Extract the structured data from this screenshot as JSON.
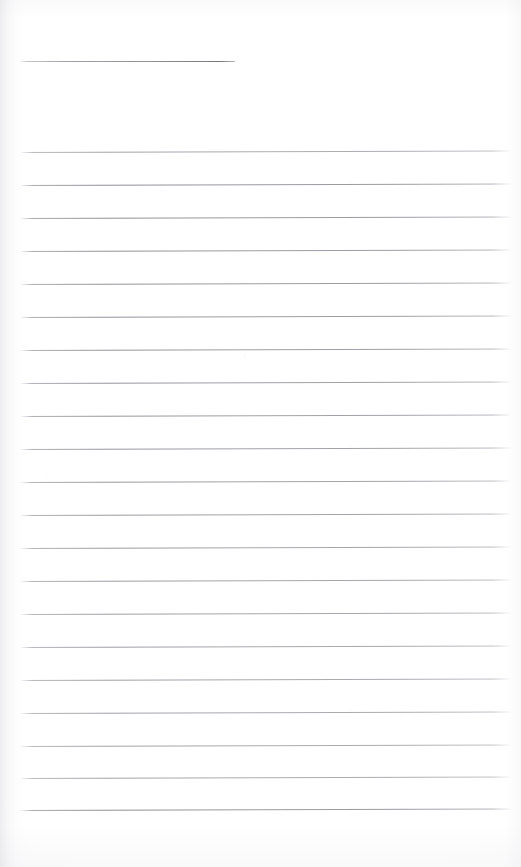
{
  "document": {
    "kind": "scanned-lined-notepad-page",
    "title": "Blank Lined Notepad Page",
    "description": "A scanned blank ruled notepad sheet with one short header rule near the top and a block of evenly spaced full-width ruled lines below.",
    "page_width": 521,
    "page_height": 867,
    "content_text": "",
    "colors": {
      "paper": "#ffffff",
      "rule_line": "#80808c",
      "edge_shadow": "#b0b0b8"
    },
    "header_rule": {
      "label": "header-rule",
      "x_start": 20,
      "x_end": 235,
      "y": 61,
      "thickness": 1
    },
    "body_rules": {
      "label": "body-rules",
      "x_start": 20,
      "x_end": 512,
      "thickness": 1,
      "count": 21,
      "y_positions": [
        152,
        185,
        218,
        251,
        284,
        317,
        350,
        383,
        416,
        449,
        482,
        515,
        548,
        581,
        614,
        647,
        680,
        713,
        746,
        778,
        810
      ],
      "skew_degrees": -0.18
    }
  }
}
